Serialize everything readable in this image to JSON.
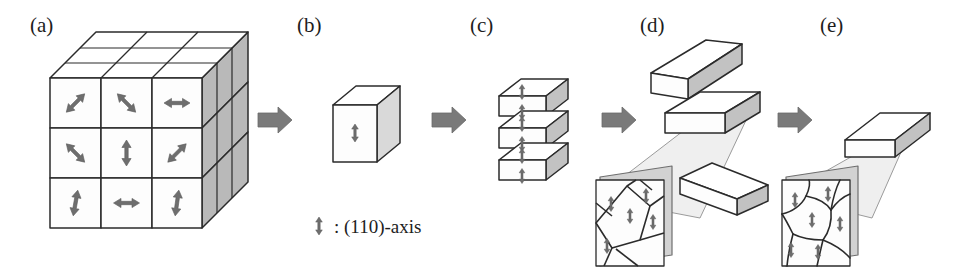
{
  "figure": {
    "type": "process-diagram",
    "background_color": "#ffffff",
    "panel_count": 5
  },
  "panels": [
    {
      "id": "a",
      "label": "(a)",
      "label_x": 30,
      "label_y": 32,
      "kind": "cube-3x3-random-orientation",
      "caption_note": "3x3x3 block with randomly oriented (110) axes on front face"
    },
    {
      "id": "b",
      "label": "(b)",
      "label_x": 297,
      "label_y": 32,
      "kind": "single-cube-aligned",
      "caption_note": "single cubic grain with vertical (110) axis"
    },
    {
      "id": "c",
      "label": "(c)",
      "label_x": 470,
      "label_y": 32,
      "kind": "stacked-platelets",
      "caption_note": "three stacked slabs, each with vertical (110) axis"
    },
    {
      "id": "d",
      "label": "(d)",
      "label_x": 640,
      "label_y": 32,
      "kind": "separated-platelets-angular-grains",
      "caption_note": "separated plates with magnified inset of angular grains"
    },
    {
      "id": "e",
      "label": "(e)",
      "label_x": 820,
      "label_y": 32,
      "kind": "single-plate-equiaxed-grains",
      "caption_note": "single thin plate with magnified inset of equiaxed rounded grains"
    }
  ],
  "legend": {
    "symbol_name": "double-headed-vertical-arrow",
    "separator": ":",
    "text": "(110)-axis",
    "full_text": ": (110)-axis",
    "x": 330,
    "y": 232
  },
  "connectors": [
    {
      "name": "arrow-a-to-b",
      "from": "a",
      "to": "b",
      "x": 258,
      "y": 120
    },
    {
      "name": "arrow-b-to-c",
      "from": "b",
      "to": "c",
      "x": 432,
      "y": 120
    },
    {
      "name": "arrow-c-to-d",
      "from": "c",
      "to": "d",
      "x": 602,
      "y": 120
    },
    {
      "name": "arrow-d-to-e",
      "from": "d",
      "to": "e",
      "x": 778,
      "y": 120
    }
  ],
  "colors": {
    "outline": "#2b2b2b",
    "face_light": "#ffffff",
    "face_shaded": "#b9b9b9",
    "face_shaded_light": "#d9d9d9",
    "arrow_gray": "#6e6e6e",
    "connector_gray": "#7a7a7a",
    "grain_line": "#2b2b2b",
    "cone_fill": "#eeeeee"
  },
  "panel_a_grid": {
    "rows": 3,
    "cols": 3,
    "arrow_angles_deg": [
      [
        45,
        135,
        90
      ],
      [
        135,
        0,
        45
      ],
      [
        10,
        90,
        8
      ]
    ],
    "arrow_angle_note": "angle measured as rotation of the double-headed arrow; 0 = vertical, 90 = horizontal"
  },
  "panel_c_slabs": {
    "count": 3,
    "arrow_direction": "vertical"
  },
  "panel_d_inset": {
    "grain_count": 6,
    "grain_shape": "angular-elongated",
    "arrow_direction": "vertical"
  },
  "panel_e_inset": {
    "grain_count": 7,
    "grain_shape": "equiaxed-rounded",
    "arrow_direction": "vertical"
  }
}
